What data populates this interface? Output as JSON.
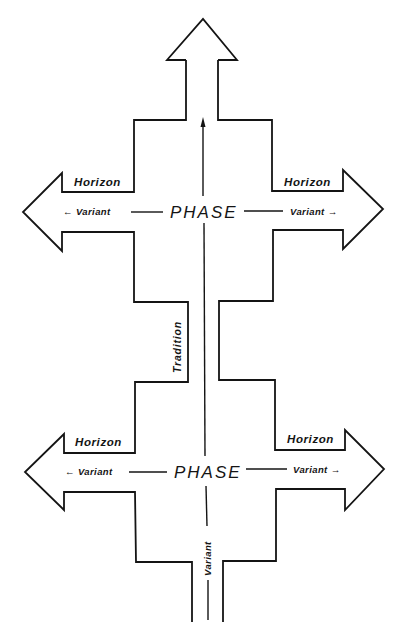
{
  "diagram": {
    "type": "phase-horizon-tradition-schema",
    "upper_phase": {
      "center_label": "PHASE",
      "left_horizon": "Horizon",
      "right_horizon": "Horizon",
      "left_variant": "← Variant",
      "right_variant": "Variant →"
    },
    "lower_phase": {
      "center_label": "PHASE",
      "left_horizon": "Horizon",
      "right_horizon": "Horizon",
      "left_variant": "← Variant",
      "right_variant": "Variant →"
    },
    "tradition_label": "Tradition",
    "trunk_variant_label": "Variant",
    "colors": {
      "stroke": "#141414",
      "background": "#ffffff"
    }
  }
}
